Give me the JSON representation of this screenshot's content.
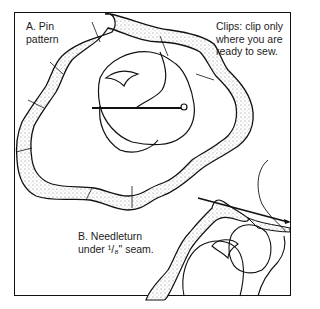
{
  "figure": {
    "labels": {
      "a_line1": "A. Pin",
      "a_line2": "pattern",
      "clips_line1": "Clips: clip only",
      "clips_line2": "where you are",
      "clips_line3": "ready to sew.",
      "b_line1": "B. Needleturn",
      "b_line2": "under ¹/₈\" seam."
    },
    "colors": {
      "ink": "#111111",
      "background": "#ffffff",
      "stipple": "#777777"
    }
  }
}
